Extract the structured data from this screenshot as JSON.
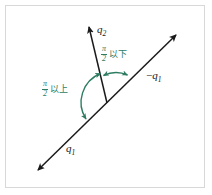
{
  "figure": {
    "type": "geometry-diagram",
    "background_color": "#ffffff",
    "border_color": "#d8d8d8",
    "line_color": "#1a1a1a",
    "accent_color": "#2e7d62",
    "axes": [
      {
        "name": "q1-axis",
        "label_positive": "q",
        "label_positive_sub": "1",
        "label_negative_prefix": "−",
        "label_negative": "q",
        "label_negative_sub": "1",
        "description": "double-headed diagonal line from lower-left to upper-right"
      },
      {
        "name": "q2-axis",
        "label": "q",
        "label_sub": "2",
        "description": "single-headed ray from vertex toward upper area"
      }
    ],
    "labels": {
      "q2": "q",
      "q2_sub": "2",
      "q1": "q",
      "q1_sub": "1",
      "minus_q1_prefix": "−",
      "minus_q1": "q",
      "minus_q1_sub": "1"
    },
    "annotations": [
      {
        "name": "small-angle-annotation",
        "numerator": "π",
        "denominator": "2",
        "text": "以下",
        "full_text": "π/2 以下",
        "color": "#2e7d62",
        "arc": "small double-headed arc between q2 ray and −q1 ray"
      },
      {
        "name": "large-angle-annotation",
        "numerator": "π",
        "denominator": "2",
        "text": "以上",
        "full_text": "π/2 以上",
        "color": "#2e7d62",
        "arc": "large double-headed arc between q2 ray and q1 ray"
      }
    ]
  }
}
